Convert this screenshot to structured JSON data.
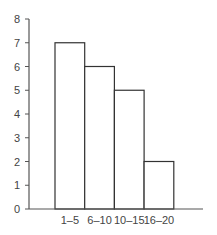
{
  "chart_data": {
    "type": "bar",
    "title": "",
    "xlabel": "",
    "ylabel": "",
    "categories": [
      "1–5",
      "6–10",
      "10–15",
      "16–20"
    ],
    "values": [
      7,
      6,
      5,
      2
    ],
    "ylim": [
      0,
      8
    ],
    "yticks": [
      0,
      1,
      2,
      3,
      4,
      5,
      6,
      7,
      8
    ],
    "grid": false,
    "legend": null,
    "bar_fill": "#ffffff",
    "bar_stroke": "#333333",
    "axis_color": "#555555"
  }
}
